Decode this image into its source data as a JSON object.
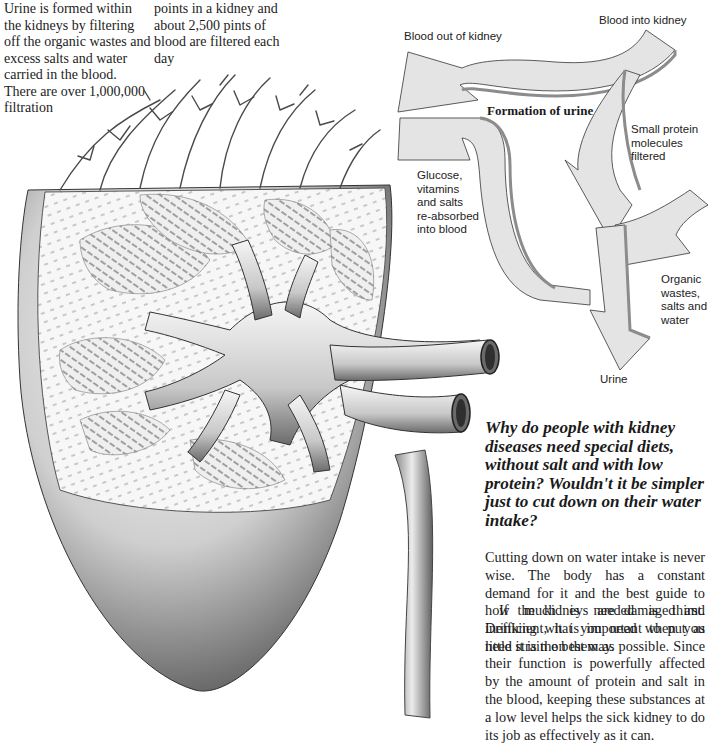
{
  "intro": {
    "column1": "Urine is formed within the kidneys by filtering off the organic wastes and excess salts and water carried in the blood. There are over 1,000,000 filtration",
    "column2": "points in a kidney and about 2,500 pints of blood are filtered each day"
  },
  "diagram": {
    "title": "Formation of urine",
    "labels": {
      "blood_in": "Blood into kidney",
      "blood_out": "Blood out of kidney",
      "protein": "Small protein\nmolecules\nfiltered",
      "reabsorbed": "Glucose,\nvitamins\nand salts\nre-absorbed\ninto blood",
      "wastes": "Organic\nwastes,\nsalts and\nwater",
      "urine": "Urine"
    },
    "colors": {
      "arrow_face": "#e4e4e4",
      "arrow_edge": "#8c8c8c",
      "outline": "#333333"
    }
  },
  "illustration": {
    "subject": "kidney cross-section with renal artery, vein and ureter",
    "colors": {
      "shade_dark": "#3a3a3a",
      "shade_mid": "#9a9a9a",
      "shade_light": "#e8e8e8"
    }
  },
  "qa": {
    "question": "Why do people with kidney diseases need special diets, without salt and with low protein? Wouldn't it be simpler just to cut down on their water intake?",
    "answer_paragraphs": [
      "Cutting down on water intake is never wise. The body has a constant demand for it and the best guide to how much is needed is thirst. Drinking what you need when you need it is the best way.",
      "If the kidneys are damaged and inefficient, it is important to put as little strain on them as possible. Since their function is powerfully affected by the amount of protein and salt in the blood, keeping these substances at a low level helps the sick kidney to do its job as effectively as it can."
    ]
  }
}
